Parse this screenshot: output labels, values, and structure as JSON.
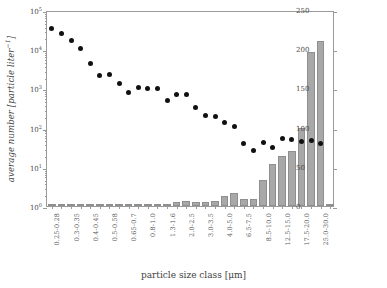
{
  "chart_data": {
    "type": "bar",
    "title": "",
    "xlabel": "particle size class [μm]",
    "ylabel": "average number [particle liter⁻¹]",
    "ylabel_right": "total particle mass [μg liter⁻¹]",
    "yscale": "log",
    "ylim": [
      1,
      100000
    ],
    "ylim_right": [
      0,
      250
    ],
    "ytick_labels_left": [
      "10",
      "10",
      "10",
      "10",
      "10",
      "10"
    ],
    "ytick_exponents_left": [
      "0",
      "1",
      "2",
      "3",
      "4",
      "5"
    ],
    "ytick_values_left": [
      1,
      10,
      100,
      1000,
      10000,
      100000
    ],
    "ytick_labels_right": [
      "0",
      "50",
      "100",
      "150",
      "200",
      "250"
    ],
    "ytick_values_right": [
      0,
      50,
      100,
      150,
      200,
      250
    ],
    "grid": false,
    "legend": "none",
    "categories": [
      "0.25-0.28",
      "",
      "0.3-0.35",
      "",
      "0.4-0.45",
      "",
      "0.5-0.58",
      "",
      "0.65-0.7",
      "",
      "0.8-1.0",
      "",
      "1.3-1.6",
      "",
      "2.0-2.5",
      "",
      "3.0-3.5",
      "",
      "4.0-5.0",
      "",
      "6.5-7.5",
      "",
      "8.5-10.0",
      "",
      "12.5-15.0",
      "",
      "17.5-20.0",
      "",
      "25.0-30.0",
      ""
    ],
    "tick_labels_shown": [
      "0.25-0.28",
      "0.3-0.35",
      "0.4-0.45",
      "0.5-0.58",
      "0.65-0.7",
      "0.8-1.0",
      "1.3-1.6",
      "2.0-2.5",
      "3.0-3.5",
      "4.0-5.0",
      "6.5-7.5",
      "8.5-10.0",
      "12.5-15.0",
      "17.5-20.0",
      "25.0-30.0"
    ],
    "series": [
      {
        "name": "average number",
        "type": "scatter",
        "axis": "left",
        "unit": "particle liter⁻¹",
        "values": [
          38000,
          28000,
          19000,
          11500,
          4800,
          2400,
          2500,
          1500,
          900,
          1200,
          1100,
          1100,
          560,
          790,
          790,
          360,
          230,
          210,
          150,
          120,
          43,
          30,
          47,
          35,
          61,
          57,
          50,
          53,
          43,
          null
        ]
      },
      {
        "name": "total particle mass",
        "type": "bar",
        "axis": "right",
        "unit": "μg liter⁻¹",
        "values": [
          0.2,
          0.2,
          0.2,
          0.2,
          0.2,
          0.2,
          0.3,
          0.3,
          0.4,
          0.5,
          0.8,
          1.2,
          2.0,
          4.5,
          6.5,
          5.0,
          5.5,
          6.0,
          12.5,
          16.0,
          9.0,
          9.0,
          33.0,
          53.0,
          64.0,
          70.0,
          100.0,
          197.0,
          210.0,
          0
        ]
      }
    ]
  }
}
